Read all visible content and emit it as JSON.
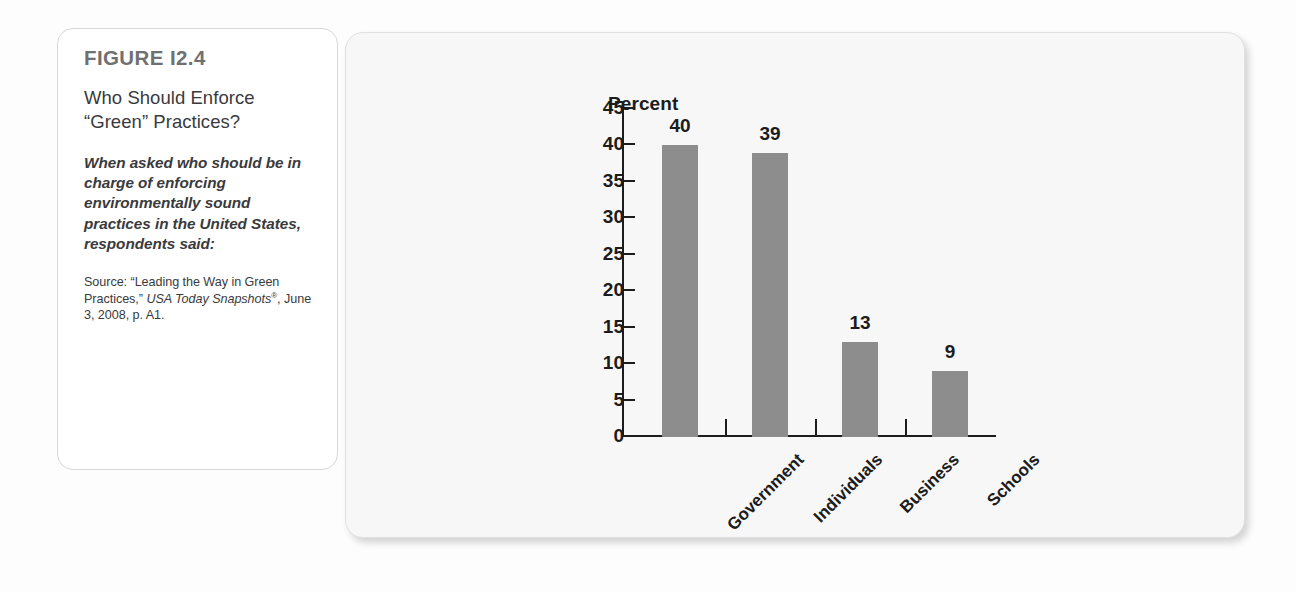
{
  "figure": {
    "number": "FIGURE I2.4",
    "title": "Who Should Enforce “Green” Practices?",
    "lead": "When asked who should be in charge of enforcing environmentally sound practices in the United States, respondents said:",
    "source_prefix": "Source: “Leading the Way in Green Practices,” ",
    "source_italic_1": "USA Today Snapshots",
    "source_registered": "®",
    "source_suffix": ", June 3, 2008, p. A1."
  },
  "colors": {
    "bar": "#8d8d8d",
    "axis": "#1c1c1c",
    "panel_background": "#f7f7f7",
    "card_border": "#d8d8d8",
    "figure_number": "#6f7072"
  },
  "chart_data": {
    "type": "bar",
    "title": "",
    "ylabel": "Percent",
    "xlabel": "",
    "categories": [
      "Government",
      "Individuals",
      "Business",
      "Schools"
    ],
    "values": [
      40,
      39,
      13,
      9
    ],
    "value_labels": [
      "40",
      "39",
      "13",
      "9"
    ],
    "ylim": [
      0,
      45
    ],
    "ytick_labels": [
      "0",
      "5",
      "10",
      "15",
      "20",
      "25",
      "30",
      "35",
      "40",
      "45"
    ],
    "ytick_values": [
      0,
      5,
      10,
      15,
      20,
      25,
      30,
      35,
      40,
      45
    ],
    "grid": false,
    "legend": "none",
    "xtick_rotation": -45
  }
}
